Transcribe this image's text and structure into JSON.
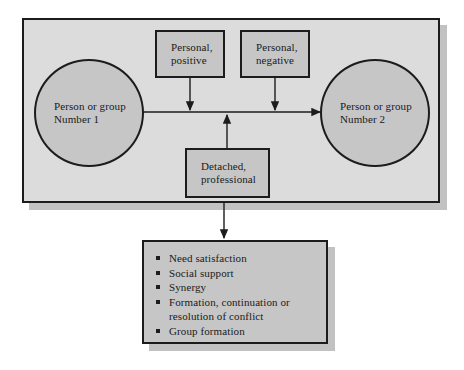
{
  "diagram": {
    "colors": {
      "panel_fill": "#dcdcdc",
      "node_fill": "#c6c6c6",
      "outline": "#1c1c1c",
      "shadow": "#c2c2c2",
      "page_background": "#ffffff"
    },
    "actors": [
      {
        "id": "person-or-group-1",
        "shape": "circle",
        "line1": "Person or group",
        "line2": "Number 1"
      },
      {
        "id": "person-or-group-2",
        "shape": "circle",
        "line1": "Person or group",
        "line2": "Number 2"
      }
    ],
    "attitude_boxes": [
      {
        "id": "personal-positive",
        "line1": "Personal,",
        "line2": "positive"
      },
      {
        "id": "personal-negative",
        "line1": "Personal,",
        "line2": "negative"
      },
      {
        "id": "detached-professional",
        "line1": "Detached,",
        "line2": "professional"
      }
    ],
    "outcomes": {
      "id": "outcomes-box",
      "bullet_glyph": "square",
      "items": [
        "Need satisfaction",
        "Social support",
        "Synergy",
        "Formation, continuation or resolution of conflict",
        "Group formation"
      ]
    },
    "connectors": [
      {
        "id": "interaction-arrow",
        "type": "double-headed-horizontal",
        "from": "person-or-group-1",
        "to": "person-or-group-2"
      },
      {
        "id": "personal-positive-arrow",
        "type": "arrow-down",
        "from": "personal-positive",
        "to": "interaction-arrow"
      },
      {
        "id": "personal-negative-arrow",
        "type": "arrow-down",
        "from": "personal-negative",
        "to": "interaction-arrow"
      },
      {
        "id": "detached-professional-arrow",
        "type": "arrow-up",
        "from": "detached-professional",
        "to": "interaction-arrow"
      },
      {
        "id": "outcomes-arrow",
        "type": "arrow-down",
        "from": "interaction-panel",
        "to": "outcomes-box"
      }
    ]
  }
}
